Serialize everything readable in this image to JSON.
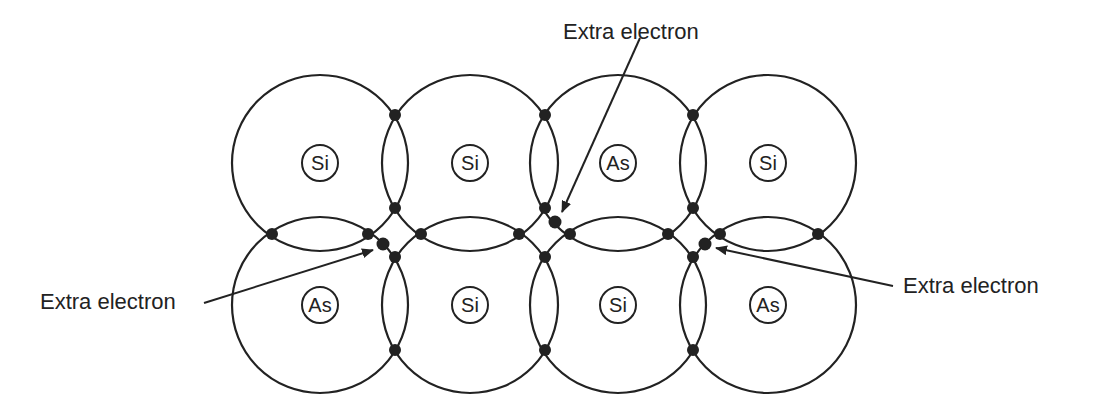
{
  "diagram": {
    "title": "",
    "atoms": [
      {
        "label": "Si",
        "row": "top",
        "col": 1
      },
      {
        "label": "Si",
        "row": "top",
        "col": 2
      },
      {
        "label": "As",
        "row": "top",
        "col": 3
      },
      {
        "label": "Si",
        "row": "top",
        "col": 4
      },
      {
        "label": "As",
        "row": "bottom",
        "col": 1
      },
      {
        "label": "Si",
        "row": "bottom",
        "col": 2
      },
      {
        "label": "Si",
        "row": "bottom",
        "col": 3
      },
      {
        "label": "As",
        "row": "bottom",
        "col": 4
      }
    ],
    "annotations": [
      {
        "text": "Extra electron",
        "position": "top-center"
      },
      {
        "text": "Extra electron",
        "position": "left"
      },
      {
        "text": "Extra electron",
        "position": "right"
      }
    ],
    "colors": {
      "stroke": "#222222",
      "background": "#ffffff"
    }
  }
}
